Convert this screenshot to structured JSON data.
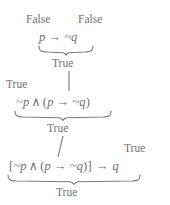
{
  "diagram": {
    "stroke_color": "#7a7a7a",
    "text_color": "#6f6f6f",
    "background": "#ffffff",
    "levels": [
      {
        "id": "level-1",
        "expression": "p → ~q",
        "parts": {
          "left": "p",
          "op": "→",
          "right": "~q"
        },
        "operand_labels": [
          {
            "id": "label-p-false",
            "text": "False"
          },
          {
            "id": "label-notq-false",
            "text": "False"
          }
        ],
        "result": "True"
      },
      {
        "id": "level-2",
        "expression": "~p ∧ (p → ~q)",
        "parts": {
          "left": "~p",
          "op": "∧",
          "open": "(",
          "inner_left": "p",
          "inner_op": "→",
          "inner_right": "~q",
          "close": ")"
        },
        "operand_labels": [
          {
            "id": "label-notp-true",
            "text": "True"
          }
        ],
        "result": "True"
      },
      {
        "id": "level-3",
        "expression": "[~p ∧ (p → ~q)] → q",
        "parts": {
          "open_bracket": "[",
          "left": "~p",
          "op": "∧",
          "open": "(",
          "inner_left": "p",
          "inner_op": "→",
          "inner_right": "~q",
          "close": ")",
          "close_bracket": "]",
          "main_op": "→",
          "right": "q"
        },
        "operand_labels": [
          {
            "id": "label-implication-true",
            "text": "True"
          }
        ],
        "result": "True"
      }
    ]
  }
}
